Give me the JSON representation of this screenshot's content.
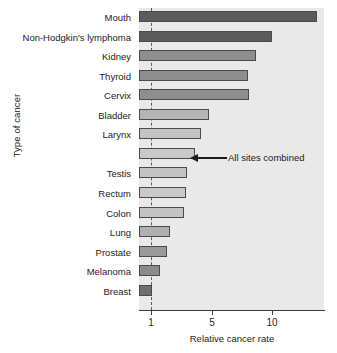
{
  "chart_data": {
    "type": "bar",
    "orientation": "horizontal",
    "title": "",
    "xlabel": "Relative cancer rate",
    "ylabel": "Type of cancer",
    "xscale": "log (broken / non-uniform spacing)",
    "xticks": [
      1,
      5,
      10
    ],
    "xticklabels": [
      "1",
      "5",
      "10"
    ],
    "grid": false,
    "legend": null,
    "reference_line": {
      "value": 1,
      "style": "dashed",
      "color": "#5a5a5a"
    },
    "categories": [
      "Mouth",
      "Non-Hodgkin's lymphoma",
      "Kidney",
      "Thyroid",
      "Cervix",
      "Bladder",
      "Larynx",
      "All sites combined",
      "Testis",
      "Rectum",
      "Colon",
      "Lung",
      "Prostate",
      "Melanoma",
      "Breast"
    ],
    "values": [
      20.0,
      10.0,
      7.8,
      6.7,
      6.8,
      3.6,
      3.1,
      2.8,
      2.4,
      2.3,
      2.2,
      1.6,
      1.5,
      1.2,
      1.0
    ],
    "annotations": [
      {
        "text": "All sites combined",
        "target_category": "All sites combined",
        "arrow": "left"
      }
    ],
    "series_colors": [
      "#5b5b5b",
      "#5b5b5b",
      "#8e8e8e",
      "#8e8e8e",
      "#8e8e8e",
      "#b5b5b5",
      "#c3c3c3",
      "#c9c9c9",
      "#c3c3c3",
      "#c9c9c9",
      "#c3c3c3",
      "#b0b0b0",
      "#9a9a9a",
      "#8a8a8a",
      "#6e6e6e"
    ],
    "bar_pixel_ends": [
      317,
      272,
      256,
      248,
      249,
      209,
      201,
      195,
      187,
      186,
      184,
      170,
      167,
      160,
      152
    ],
    "plot_background": "#e9e9e9"
  }
}
